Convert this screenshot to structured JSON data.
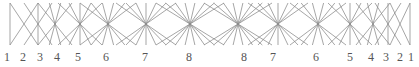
{
  "diagram": {
    "line_color": "#8a8a8a",
    "top_y": 3,
    "bottom_y": 45,
    "center_y": 24,
    "bundles": [
      {
        "label": "1",
        "cx": 10,
        "count": 1,
        "spread": 0
      },
      {
        "label": "2",
        "cx": 24,
        "count": 2,
        "spread": 14
      },
      {
        "label": "3",
        "cx": 38,
        "count": 3,
        "spread": 14
      },
      {
        "label": "4",
        "cx": 55,
        "count": 4,
        "spread": 17
      },
      {
        "label": "5",
        "cx": 80,
        "count": 5,
        "spread": 22
      },
      {
        "label": "6",
        "cx": 108,
        "count": 6,
        "spread": 28
      },
      {
        "label": "7",
        "cx": 146,
        "count": 7,
        "spread": 30
      },
      {
        "label": "8",
        "cx": 190,
        "count": 8,
        "spread": 34
      },
      {
        "label": "8",
        "cx": 238,
        "count": 8,
        "spread": 34
      },
      {
        "label": "7",
        "cx": 278,
        "count": 7,
        "spread": 30
      },
      {
        "label": "6",
        "cx": 318,
        "count": 6,
        "spread": 28
      },
      {
        "label": "5",
        "cx": 350,
        "count": 5,
        "spread": 22
      },
      {
        "label": "4",
        "cx": 373,
        "count": 4,
        "spread": 17
      },
      {
        "label": "3",
        "cx": 388,
        "count": 3,
        "spread": 13
      },
      {
        "label": "2",
        "cx": 400,
        "count": 2,
        "spread": 10
      },
      {
        "label": "1",
        "cx": 410,
        "count": 1,
        "spread": 0
      }
    ]
  },
  "labels": [
    {
      "text": "1",
      "x": 7
    },
    {
      "text": "2",
      "x": 23
    },
    {
      "text": "3",
      "x": 40
    },
    {
      "text": "4",
      "x": 57
    },
    {
      "text": "5",
      "x": 78
    },
    {
      "text": "6",
      "x": 106
    },
    {
      "text": "7",
      "x": 145
    },
    {
      "text": "8",
      "x": 189
    },
    {
      "text": "8",
      "x": 244
    },
    {
      "text": "7",
      "x": 273
    },
    {
      "text": "6",
      "x": 316
    },
    {
      "text": "5",
      "x": 350
    },
    {
      "text": "4",
      "x": 371
    },
    {
      "text": "3",
      "x": 386
    },
    {
      "text": "2",
      "x": 400
    },
    {
      "text": "1",
      "x": 411
    }
  ]
}
